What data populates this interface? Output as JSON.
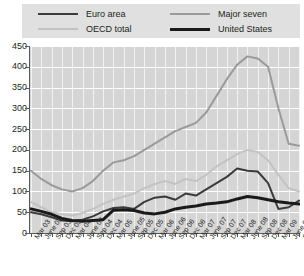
{
  "legend": {
    "items": [
      {
        "label": "Euro area",
        "color": "#3b3b3b",
        "width": 2.0
      },
      {
        "label": "OECD total",
        "color": "#c3c3c3",
        "width": 2.0
      },
      {
        "label": "Major seven",
        "color": "#9a9a9a",
        "width": 2.0
      },
      {
        "label": "United States",
        "color": "#1a1a1a",
        "width": 3.0
      }
    ],
    "background": "#e0e0e0"
  },
  "axes": {
    "y_ticks": [
      450,
      400,
      350,
      300,
      250,
      200,
      150,
      100,
      50,
      0
    ],
    "y_min": 0,
    "y_max": 450,
    "plot_background": "#d5d5d5",
    "gridline_color": "#ffffff",
    "axis_color": "#58595b"
  },
  "chart_data": {
    "type": "line",
    "title": "",
    "xlabel": "",
    "ylabel": "",
    "ylim": [
      0,
      450
    ],
    "grid": true,
    "legend_position": "top",
    "categories": [
      "Mar 03",
      "June 03",
      "Sep 03",
      "Dec 03",
      "Mar 04",
      "June 04",
      "Sep 04",
      "Dec 04",
      "Mar 05",
      "June 05",
      "Sep 05",
      "Dec 05",
      "Mar 06",
      "June 06",
      "Sep 06",
      "Dec 06",
      "Mar 07",
      "June 07",
      "Sep 07",
      "Dec 07",
      "Mar 08",
      "June 08",
      "Sep 08",
      "Dec 08",
      "Mar 09",
      "June 09",
      "Sep 09"
    ],
    "series": [
      {
        "name": "Major seven",
        "color": "#9a9a9a",
        "values": [
          150,
          130,
          115,
          105,
          100,
          108,
          125,
          150,
          170,
          175,
          185,
          200,
          215,
          230,
          245,
          255,
          265,
          290,
          330,
          370,
          405,
          425,
          420,
          400,
          300,
          215,
          210
        ]
      },
      {
        "name": "OECD total",
        "color": "#c3c3c3",
        "values": [
          75,
          62,
          50,
          45,
          42,
          48,
          58,
          70,
          80,
          88,
          95,
          108,
          118,
          125,
          118,
          130,
          125,
          140,
          160,
          175,
          190,
          200,
          195,
          175,
          140,
          108,
          100
        ]
      },
      {
        "name": "Euro area",
        "color": "#3b3b3b",
        "values": [
          50,
          45,
          38,
          30,
          28,
          32,
          40,
          52,
          60,
          62,
          58,
          75,
          85,
          88,
          80,
          95,
          90,
          105,
          120,
          135,
          155,
          150,
          148,
          120,
          58,
          62,
          78
        ]
      },
      {
        "name": "United States",
        "color": "#1a1a1a",
        "values": [
          58,
          52,
          45,
          35,
          30,
          28,
          30,
          32,
          55,
          56,
          54,
          48,
          46,
          50,
          58,
          62,
          65,
          70,
          72,
          75,
          82,
          88,
          85,
          80,
          75,
          72,
          70
        ]
      }
    ]
  }
}
